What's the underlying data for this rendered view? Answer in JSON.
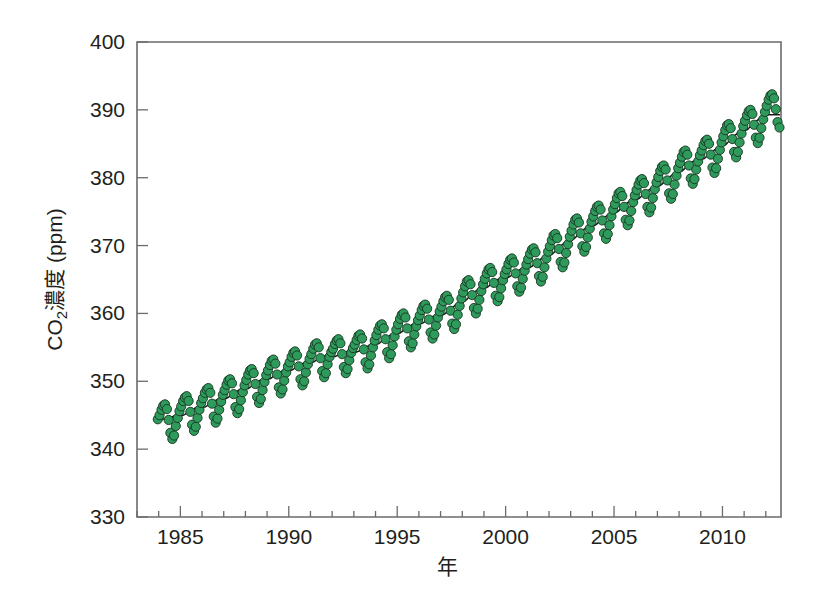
{
  "chart_data": {
    "type": "scatter",
    "title": "",
    "subtitle": "",
    "xlabel": "年",
    "ylabel": "CO2濃度 (ppm)",
    "ylabel_base": "CO",
    "ylabel_sub": "2",
    "ylabel_rest": "濃度 (ppm)",
    "xlim": [
      1983.0,
      11.0
    ],
    "x_min": 1983.0,
    "x_max": 2012.7,
    "ylim": [
      330,
      400
    ],
    "y_min": 330,
    "y_max": 400,
    "grid": false,
    "legend": null,
    "x_ticks_major": [
      1985,
      1990,
      1995,
      2000,
      2005,
      2010
    ],
    "x_ticks_major_labels": [
      "1985",
      "1990",
      "1995",
      "2000",
      "2005",
      "2010"
    ],
    "x_tick_minor_step": 1,
    "y_ticks": [
      330,
      340,
      350,
      360,
      370,
      380,
      390,
      400
    ],
    "y_tick_labels": [
      "330",
      "340",
      "350",
      "360",
      "370",
      "380",
      "390",
      "400"
    ],
    "marker": {
      "shape": "circle",
      "fill_color": "#2e9b5c",
      "edge_color": "#16341f",
      "radius_px": 4.6
    },
    "trend": {
      "name": "trend line",
      "color": "#1a1a1a",
      "description": "smooth deseasonalized trend"
    },
    "series_description": "Monthly mean atmospheric CO2 concentration with seasonal cycle, rising from about 344 ppm in 1984 to about 392 ppm in 2012",
    "seasonal_amplitude_ppm": 6.2,
    "series": [
      {
        "name": "CO2濃度",
        "x": [
          1983.96,
          1984.04,
          1984.13,
          1984.21,
          1984.29,
          1984.38,
          1984.46,
          1984.54,
          1984.63,
          1984.71,
          1984.79,
          1984.88,
          1984.96,
          1985.04,
          1985.13,
          1985.21,
          1985.29,
          1985.38,
          1985.46,
          1985.54,
          1985.63,
          1985.71,
          1985.79,
          1985.88,
          1985.96,
          1986.04,
          1986.13,
          1986.21,
          1986.29,
          1986.38,
          1986.46,
          1986.54,
          1986.63,
          1986.71,
          1986.79,
          1986.88,
          1986.96,
          1987.04,
          1987.13,
          1987.21,
          1987.29,
          1987.38,
          1987.46,
          1987.54,
          1987.63,
          1987.71,
          1987.79,
          1987.88,
          1987.96,
          1988.04,
          1988.13,
          1988.21,
          1988.29,
          1988.38,
          1988.46,
          1988.54,
          1988.63,
          1988.71,
          1988.79,
          1988.88,
          1988.96,
          1989.04,
          1989.13,
          1989.21,
          1989.29,
          1989.38,
          1989.46,
          1989.54,
          1989.63,
          1989.71,
          1989.79,
          1989.88,
          1989.96,
          1990.04,
          1990.13,
          1990.21,
          1990.29,
          1990.38,
          1990.46,
          1990.54,
          1990.63,
          1990.71,
          1990.79,
          1990.88,
          1990.96,
          1991.04,
          1991.13,
          1991.21,
          1991.29,
          1991.38,
          1991.46,
          1991.54,
          1991.63,
          1991.71,
          1991.79,
          1991.88,
          1991.96,
          1992.04,
          1992.13,
          1992.21,
          1992.29,
          1992.38,
          1992.46,
          1992.54,
          1992.63,
          1992.71,
          1992.79,
          1992.88,
          1992.96,
          1993.04,
          1993.13,
          1993.21,
          1993.29,
          1993.38,
          1993.46,
          1993.54,
          1993.63,
          1993.71,
          1993.79,
          1993.88,
          1993.96,
          1994.04,
          1994.13,
          1994.21,
          1994.29,
          1994.38,
          1994.46,
          1994.54,
          1994.63,
          1994.71,
          1994.79,
          1994.88,
          1994.96,
          1995.04,
          1995.13,
          1995.21,
          1995.29,
          1995.38,
          1995.46,
          1995.54,
          1995.63,
          1995.71,
          1995.79,
          1995.88,
          1995.96,
          1996.04,
          1996.13,
          1996.21,
          1996.29,
          1996.38,
          1996.46,
          1996.54,
          1996.63,
          1996.71,
          1996.79,
          1996.88,
          1996.96,
          1997.04,
          1997.13,
          1997.21,
          1997.29,
          1997.38,
          1997.46,
          1997.54,
          1997.63,
          1997.71,
          1997.79,
          1997.88,
          1997.96,
          1998.04,
          1998.13,
          1998.21,
          1998.29,
          1998.38,
          1998.46,
          1998.54,
          1998.63,
          1998.71,
          1998.79,
          1998.88,
          1998.96,
          1999.04,
          1999.13,
          1999.21,
          1999.29,
          1999.38,
          1999.46,
          1999.54,
          1999.63,
          1999.71,
          1999.79,
          1999.88,
          1999.96,
          2000.04,
          2000.13,
          2000.21,
          2000.29,
          2000.38,
          2000.46,
          2000.54,
          2000.63,
          2000.71,
          2000.79,
          2000.88,
          2000.96,
          2001.04,
          2001.13,
          2001.21,
          2001.29,
          2001.38,
          2001.46,
          2001.54,
          2001.63,
          2001.71,
          2001.79,
          2001.88,
          2001.96,
          2002.04,
          2002.13,
          2002.21,
          2002.29,
          2002.38,
          2002.46,
          2002.54,
          2002.63,
          2002.71,
          2002.79,
          2002.88,
          2002.96,
          2003.04,
          2003.13,
          2003.21,
          2003.29,
          2003.38,
          2003.46,
          2003.54,
          2003.63,
          2003.71,
          2003.79,
          2003.88,
          2003.96,
          2004.04,
          2004.13,
          2004.21,
          2004.29,
          2004.38,
          2004.46,
          2004.54,
          2004.63,
          2004.71,
          2004.79,
          2004.88,
          2004.96,
          2005.04,
          2005.13,
          2005.21,
          2005.29,
          2005.38,
          2005.46,
          2005.54,
          2005.63,
          2005.71,
          2005.79,
          2005.88,
          2005.96,
          2006.04,
          2006.13,
          2006.21,
          2006.29,
          2006.38,
          2006.46,
          2006.54,
          2006.63,
          2006.71,
          2006.79,
          2006.88,
          2006.96,
          2007.04,
          2007.13,
          2007.21,
          2007.29,
          2007.38,
          2007.46,
          2007.54,
          2007.63,
          2007.71,
          2007.79,
          2007.88,
          2007.96,
          2008.04,
          2008.13,
          2008.21,
          2008.29,
          2008.38,
          2008.46,
          2008.54,
          2008.63,
          2008.71,
          2008.79,
          2008.88,
          2008.96,
          2009.04,
          2009.13,
          2009.21,
          2009.29,
          2009.38,
          2009.46,
          2009.54,
          2009.63,
          2009.71,
          2009.79,
          2009.88,
          2009.96,
          2010.04,
          2010.13,
          2010.21,
          2010.29,
          2010.38,
          2010.46,
          2010.54,
          2010.63,
          2010.71,
          2010.79,
          2010.88,
          2010.96,
          2011.04,
          2011.13,
          2011.21,
          2011.29,
          2011.38,
          2011.46,
          2011.54,
          2011.63,
          2011.71,
          2011.79,
          2011.88,
          2011.96,
          2012.04,
          2012.13,
          2012.21,
          2012.29,
          2012.38,
          2012.46,
          2012.54,
          2012.63
        ],
        "y": [
          344.4,
          345.0,
          345.8,
          346.4,
          346.6,
          345.9,
          344.3,
          342.4,
          341.5,
          342.0,
          343.4,
          344.6,
          345.6,
          346.3,
          347.1,
          347.6,
          347.8,
          347.1,
          345.5,
          343.6,
          342.7,
          343.3,
          344.6,
          345.8,
          346.8,
          347.5,
          348.3,
          348.8,
          349.0,
          348.3,
          346.7,
          344.8,
          343.9,
          344.5,
          345.8,
          347.0,
          348.0,
          348.7,
          349.5,
          350.1,
          350.3,
          349.7,
          348.1,
          346.2,
          345.3,
          345.9,
          347.2,
          348.4,
          349.4,
          350.2,
          351.0,
          351.6,
          351.8,
          351.2,
          349.6,
          347.7,
          346.8,
          347.4,
          348.7,
          349.9,
          350.9,
          351.6,
          352.4,
          353.0,
          353.2,
          352.6,
          351.0,
          349.1,
          348.2,
          348.8,
          350.1,
          351.3,
          352.2,
          352.8,
          353.6,
          354.2,
          354.4,
          353.8,
          352.2,
          350.3,
          349.4,
          350.0,
          351.3,
          352.5,
          353.3,
          354.0,
          354.8,
          355.4,
          355.6,
          355.0,
          353.4,
          351.5,
          350.6,
          351.2,
          352.5,
          353.6,
          354.3,
          354.8,
          355.5,
          356.0,
          356.2,
          355.6,
          354.0,
          352.1,
          351.2,
          351.8,
          353.1,
          354.2,
          354.9,
          355.4,
          356.1,
          356.7,
          356.9,
          356.3,
          354.7,
          352.8,
          351.9,
          352.5,
          353.8,
          355.0,
          356.0,
          356.8,
          357.6,
          358.2,
          358.4,
          357.8,
          356.2,
          354.3,
          353.4,
          354.0,
          355.3,
          356.6,
          357.6,
          358.4,
          359.2,
          359.8,
          360.0,
          359.4,
          357.8,
          355.9,
          355.0,
          355.6,
          356.9,
          358.1,
          359.0,
          359.7,
          360.5,
          361.1,
          361.3,
          360.7,
          359.1,
          357.2,
          356.3,
          356.9,
          358.2,
          359.4,
          360.3,
          361.0,
          361.8,
          362.4,
          362.6,
          362.0,
          360.4,
          358.5,
          357.7,
          358.4,
          359.8,
          361.1,
          362.2,
          363.1,
          364.0,
          364.7,
          364.9,
          364.3,
          362.7,
          360.8,
          360.0,
          360.7,
          362.0,
          363.3,
          364.3,
          365.1,
          365.9,
          366.5,
          366.7,
          366.1,
          364.5,
          362.6,
          361.8,
          362.4,
          363.7,
          364.9,
          365.8,
          366.5,
          367.3,
          367.9,
          368.1,
          367.5,
          365.9,
          364.0,
          363.2,
          363.8,
          365.1,
          366.3,
          367.2,
          368.0,
          368.8,
          369.4,
          369.6,
          369.0,
          367.4,
          365.5,
          364.7,
          365.4,
          366.8,
          368.1,
          369.1,
          369.9,
          370.8,
          371.5,
          371.7,
          371.1,
          369.5,
          367.6,
          366.8,
          367.5,
          368.9,
          370.2,
          371.3,
          372.2,
          373.1,
          373.8,
          374.0,
          373.4,
          371.8,
          369.9,
          369.1,
          369.8,
          371.2,
          372.5,
          373.5,
          374.3,
          375.1,
          375.7,
          375.9,
          375.3,
          373.7,
          371.8,
          371.0,
          371.7,
          373.0,
          374.3,
          375.3,
          376.1,
          377.0,
          377.7,
          377.9,
          377.3,
          375.7,
          373.8,
          373.0,
          373.7,
          375.1,
          376.4,
          377.4,
          378.2,
          379.0,
          379.6,
          379.8,
          379.2,
          377.6,
          375.7,
          374.9,
          375.6,
          377.0,
          378.3,
          379.3,
          380.1,
          381.0,
          381.6,
          381.8,
          381.2,
          379.6,
          377.7,
          376.9,
          377.6,
          379.0,
          380.3,
          381.4,
          382.2,
          383.1,
          383.8,
          384.0,
          383.4,
          381.8,
          379.9,
          379.1,
          379.8,
          381.2,
          382.4,
          383.3,
          384.0,
          384.8,
          385.4,
          385.6,
          385.0,
          383.4,
          381.5,
          380.7,
          381.4,
          382.8,
          384.1,
          385.2,
          386.1,
          387.0,
          387.7,
          387.9,
          387.3,
          385.7,
          383.8,
          383.0,
          383.8,
          385.2,
          386.5,
          387.6,
          388.4,
          389.2,
          389.8,
          390.0,
          389.4,
          387.8,
          385.9,
          385.1,
          385.9,
          387.3,
          388.6,
          389.7,
          390.6,
          391.5,
          392.1,
          392.3,
          391.7,
          390.1,
          388.2,
          387.4
        ]
      }
    ]
  }
}
